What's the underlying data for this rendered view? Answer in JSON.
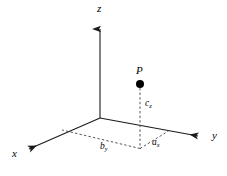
{
  "figure": {
    "type": "diagram",
    "background_color": "#ffffff",
    "line_color": "#1a1a1a",
    "dashed_color": "#555555",
    "point_color": "#000000"
  },
  "axes": [
    {
      "name": "z",
      "label": "z",
      "direction": "up",
      "origin": [
        100,
        118
      ],
      "tip": [
        100,
        22
      ],
      "style": "solid",
      "arrowhead": true
    },
    {
      "name": "x",
      "label": "x",
      "direction": "down-left",
      "origin": [
        100,
        118
      ],
      "tip": [
        22,
        152
      ],
      "style": "solid",
      "arrowhead": true
    },
    {
      "name": "y",
      "label": "y",
      "direction": "down-right",
      "origin": [
        100,
        118
      ],
      "tip": [
        205,
        137
      ],
      "style": "solid",
      "arrowhead": true
    }
  ],
  "point": {
    "label": "P",
    "position": [
      140,
      84
    ],
    "marker": "filled-circle",
    "radius": 4
  },
  "projection": {
    "foot": [
      140,
      148
    ],
    "drop_line_style": "dashed",
    "drop_line_label": "c",
    "drop_line_subscript": "z"
  },
  "components": [
    {
      "label": "b",
      "subscript": "y",
      "from": [
        140,
        148
      ],
      "to": [
        62,
        130
      ],
      "style": "dashed",
      "label_position": [
        100,
        142
      ]
    },
    {
      "label": "a",
      "subscript": "x",
      "from": [
        140,
        148
      ],
      "to": [
        168,
        131
      ],
      "style": "dashed",
      "label_position": [
        152,
        138
      ]
    },
    {
      "label": "c",
      "subscript": "z",
      "from": [
        140,
        84
      ],
      "to": [
        140,
        148
      ],
      "style": "dashed",
      "label_position": [
        145,
        99
      ]
    }
  ],
  "labels": {
    "z_axis": "z",
    "x_axis": "x",
    "y_axis": "y",
    "point": "P",
    "c_base": "c",
    "c_sub": "z",
    "b_base": "b",
    "b_sub": "y",
    "a_base": "a",
    "a_sub": "x"
  }
}
